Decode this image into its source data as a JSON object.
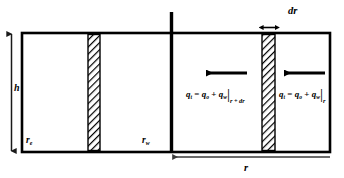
{
  "figure": {
    "type": "radial-flow-reservoir-schematic",
    "geometry": {
      "box": {
        "x": 22,
        "y": 33,
        "width": 308,
        "height": 119
      },
      "wellbore_line_x": 171,
      "wellbore_line_top": 12,
      "hatched_band_left": {
        "x": 88,
        "width": 12
      },
      "hatched_band_right": {
        "x": 262,
        "width": 13
      },
      "arrow_y": 73,
      "arrow_left": {
        "x_start": 247,
        "x_end": 205
      },
      "arrow_right": {
        "x_start": 325,
        "x_end": 283
      },
      "dimension_r_y": 157,
      "dimension_h_x": 11
    },
    "colors": {
      "stroke": "#000000",
      "background": "#ffffff",
      "hatch": "#000000",
      "dimension_line": "#3a3a3a"
    }
  },
  "labels": {
    "height": "h",
    "external_radius": {
      "base": "r",
      "sub": "e"
    },
    "wellbore_radius": {
      "base": "r",
      "sub": "w"
    },
    "element_thickness": "dr",
    "radius": "r"
  },
  "equations": {
    "left": {
      "lhs_base": "q",
      "lhs_sub": "t",
      "equals": " = ",
      "term1_base": "q",
      "term1_sub": "o",
      "plus": " + ",
      "term2_base": "q",
      "term2_sub": "w",
      "eval_at": "r + dr"
    },
    "right": {
      "lhs_base": "q",
      "lhs_sub": "t",
      "equals": " = ",
      "term1_base": "q",
      "term1_sub": "o",
      "plus": " + ",
      "term2_base": "q",
      "term2_sub": "w",
      "eval_at": "r"
    }
  },
  "icons": {
    "flow_arrow_inner": "left-arrow-icon",
    "flow_arrow_outer": "left-arrow-icon",
    "dr_dimension": "double-headed-arrow-icon",
    "h_dimension": "vertical-double-headed-arrow-icon",
    "r_dimension": "left-pointing-dimension-arrow-icon"
  }
}
